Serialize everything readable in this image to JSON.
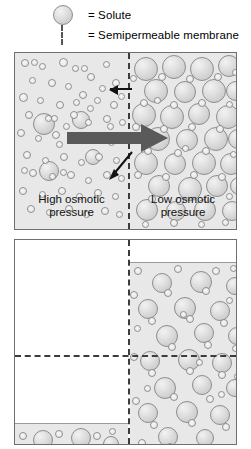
{
  "figure": {
    "background_color": "#ffffff",
    "fluid_color": "#e8e8e8",
    "membrane_color": "#3c3c3c",
    "arrow_color": "#5a5a5a",
    "outline_color": "#6f6f6f"
  },
  "legend": {
    "items": [
      {
        "icon": "solute-circle-icon",
        "equals": "= Solute"
      },
      {
        "icon": "dashed-line-icon",
        "equals": "= Semipermeable membrane"
      }
    ]
  },
  "top_panel": {
    "left_label_line1": "High osmotic",
    "left_label_line2": "pressure",
    "right_label_line1": "Low osmotic",
    "right_label_line2": "pressure",
    "arrows": [
      {
        "name": "water-flow-arrow-left",
        "direction": "left",
        "style": "thin-black"
      },
      {
        "name": "net-water-flow-arrow",
        "direction": "right",
        "style": "thick-gray"
      },
      {
        "name": "membrane-pointer-arrow",
        "direction": "down-left",
        "style": "thin-black"
      }
    ],
    "left_side": {
      "solute_size": "small",
      "description": "many small solute particles"
    },
    "right_side": {
      "solute_size": "large",
      "description": "many large solute particles"
    }
  },
  "bottom_panel": {
    "left_side": {
      "fill": "low",
      "description": "fluid level dropped, nearly empty"
    },
    "right_side": {
      "fill": "high",
      "description": "fluid level risen, dense solute"
    },
    "equilibrium_line": "horizontal dashed level line"
  },
  "circle_sets": {
    "top_left_small": [
      [
        6,
        6,
        8
      ],
      [
        24,
        10,
        7
      ],
      [
        44,
        5,
        9
      ],
      [
        57,
        12,
        7
      ],
      [
        72,
        20,
        8
      ],
      [
        14,
        24,
        7
      ],
      [
        33,
        26,
        8
      ],
      [
        50,
        30,
        7
      ],
      [
        88,
        8,
        7
      ],
      [
        97,
        26,
        8
      ],
      [
        64,
        38,
        8
      ],
      [
        4,
        40,
        9
      ],
      [
        22,
        44,
        7
      ],
      [
        41,
        48,
        8
      ],
      [
        79,
        44,
        7
      ],
      [
        95,
        48,
        8
      ],
      [
        10,
        58,
        8
      ],
      [
        30,
        62,
        7
      ],
      [
        55,
        58,
        8
      ],
      [
        70,
        66,
        7
      ],
      [
        88,
        62,
        8
      ],
      [
        103,
        40,
        7
      ],
      [
        104,
        66,
        7
      ],
      [
        2,
        76,
        8
      ],
      [
        20,
        82,
        7
      ],
      [
        37,
        78,
        8
      ],
      [
        60,
        84,
        7
      ],
      [
        77,
        80,
        8
      ],
      [
        93,
        86,
        7
      ],
      [
        48,
        70,
        7
      ],
      [
        8,
        98,
        8
      ],
      [
        27,
        104,
        7
      ],
      [
        45,
        100,
        8
      ],
      [
        63,
        106,
        7
      ],
      [
        80,
        100,
        8
      ],
      [
        98,
        104,
        7
      ],
      [
        14,
        116,
        8
      ],
      [
        34,
        120,
        7
      ],
      [
        52,
        118,
        8
      ],
      [
        70,
        124,
        7
      ],
      [
        88,
        118,
        8
      ],
      [
        103,
        122,
        7
      ],
      [
        4,
        134,
        8
      ],
      [
        24,
        138,
        7
      ],
      [
        43,
        134,
        8
      ],
      [
        61,
        140,
        7
      ],
      [
        79,
        136,
        8
      ],
      [
        97,
        140,
        7
      ],
      [
        12,
        152,
        8
      ],
      [
        31,
        156,
        7
      ],
      [
        50,
        152,
        8
      ],
      [
        68,
        158,
        7
      ],
      [
        86,
        154,
        8
      ],
      [
        101,
        158,
        7
      ],
      [
        41,
        88,
        7
      ],
      [
        66,
        12,
        7
      ],
      [
        16,
        6,
        7
      ],
      [
        84,
        32,
        7
      ],
      [
        58,
        46,
        7
      ],
      [
        36,
        62,
        7
      ],
      [
        72,
        52,
        7
      ],
      [
        92,
        70,
        7
      ],
      [
        6,
        114,
        7
      ],
      [
        45,
        116,
        7
      ]
    ],
    "top_left_large": [
      [
        18,
        60,
        22
      ],
      [
        57,
        58,
        18
      ],
      [
        24,
        108,
        20
      ],
      [
        70,
        96,
        16
      ]
    ],
    "top_right_large": [
      [
        4,
        4,
        24
      ],
      [
        32,
        2,
        24
      ],
      [
        60,
        4,
        24
      ],
      [
        88,
        2,
        22
      ],
      [
        14,
        26,
        24
      ],
      [
        44,
        28,
        22
      ],
      [
        72,
        26,
        24
      ],
      [
        96,
        28,
        20
      ],
      [
        2,
        50,
        24
      ],
      [
        30,
        52,
        24
      ],
      [
        58,
        50,
        22
      ],
      [
        86,
        52,
        24
      ],
      [
        16,
        74,
        24
      ],
      [
        46,
        76,
        22
      ],
      [
        74,
        74,
        24
      ],
      [
        98,
        76,
        20
      ],
      [
        4,
        98,
        24
      ],
      [
        34,
        100,
        22
      ],
      [
        62,
        98,
        24
      ],
      [
        90,
        100,
        22
      ],
      [
        18,
        122,
        22
      ],
      [
        48,
        124,
        24
      ],
      [
        76,
        122,
        22
      ],
      [
        100,
        124,
        18
      ],
      [
        6,
        146,
        22
      ],
      [
        36,
        148,
        20
      ],
      [
        64,
        146,
        22
      ],
      [
        92,
        148,
        20
      ]
    ],
    "top_right_small": [
      [
        28,
        20,
        8
      ],
      [
        56,
        22,
        8
      ],
      [
        84,
        20,
        8
      ],
      [
        10,
        46,
        8
      ],
      [
        40,
        48,
        8
      ],
      [
        68,
        46,
        8
      ],
      [
        96,
        48,
        7
      ],
      [
        2,
        70,
        8
      ],
      [
        30,
        72,
        8
      ],
      [
        58,
        70,
        8
      ],
      [
        86,
        72,
        8
      ],
      [
        14,
        94,
        8
      ],
      [
        44,
        96,
        8
      ],
      [
        72,
        94,
        8
      ],
      [
        4,
        118,
        8
      ],
      [
        32,
        120,
        8
      ],
      [
        60,
        118,
        8
      ],
      [
        88,
        120,
        8
      ],
      [
        18,
        142,
        8
      ],
      [
        46,
        144,
        8
      ],
      [
        74,
        142,
        8
      ],
      [
        100,
        98,
        7
      ],
      [
        102,
        16,
        7
      ],
      [
        0,
        22,
        7
      ],
      [
        24,
        44,
        7
      ],
      [
        52,
        92,
        7
      ],
      [
        96,
        140,
        7
      ],
      [
        12,
        168,
        7
      ],
      [
        40,
        166,
        8
      ],
      [
        68,
        168,
        7
      ],
      [
        92,
        166,
        7
      ]
    ],
    "bottom_right_large": [
      [
        22,
        10,
        20
      ],
      [
        60,
        8,
        22
      ],
      [
        96,
        14,
        18
      ],
      [
        8,
        36,
        20
      ],
      [
        44,
        34,
        22
      ],
      [
        80,
        38,
        20
      ],
      [
        26,
        62,
        22
      ],
      [
        64,
        60,
        20
      ],
      [
        98,
        64,
        18
      ],
      [
        10,
        88,
        20
      ],
      [
        48,
        86,
        22
      ],
      [
        82,
        90,
        20
      ],
      [
        24,
        114,
        22
      ],
      [
        62,
        112,
        20
      ],
      [
        96,
        116,
        18
      ],
      [
        8,
        140,
        20
      ],
      [
        46,
        138,
        22
      ],
      [
        80,
        142,
        20
      ],
      [
        28,
        164,
        20
      ],
      [
        66,
        166,
        18
      ]
    ],
    "bottom_right_small": [
      [
        4,
        4,
        8
      ],
      [
        44,
        2,
        8
      ],
      [
        82,
        4,
        8
      ],
      [
        100,
        2,
        7
      ],
      [
        34,
        26,
        8
      ],
      [
        72,
        24,
        8
      ],
      [
        0,
        28,
        8
      ],
      [
        96,
        34,
        7
      ],
      [
        18,
        54,
        8
      ],
      [
        56,
        52,
        8
      ],
      [
        90,
        56,
        8
      ],
      [
        4,
        62,
        7
      ],
      [
        38,
        80,
        8
      ],
      [
        74,
        78,
        8
      ],
      [
        102,
        82,
        7
      ],
      [
        0,
        90,
        8
      ],
      [
        18,
        106,
        8
      ],
      [
        56,
        104,
        8
      ],
      [
        88,
        108,
        8
      ],
      [
        104,
        110,
        7
      ],
      [
        40,
        130,
        8
      ],
      [
        76,
        132,
        8
      ],
      [
        2,
        134,
        8
      ],
      [
        20,
        158,
        8
      ],
      [
        58,
        156,
        8
      ],
      [
        92,
        160,
        8
      ],
      [
        106,
        154,
        7
      ],
      [
        36,
        180,
        8
      ],
      [
        72,
        182,
        8
      ],
      [
        8,
        176,
        8
      ],
      [
        50,
        48,
        7
      ],
      [
        88,
        128,
        7
      ],
      [
        14,
        122,
        7
      ],
      [
        66,
        96,
        7
      ]
    ],
    "bottom_left_large": [
      [
        18,
        6,
        20
      ],
      [
        56,
        4,
        20
      ],
      [
        12,
        26,
        18
      ],
      [
        52,
        28,
        18
      ],
      [
        88,
        12,
        16
      ]
    ],
    "bottom_left_small": [
      [
        4,
        8,
        8
      ],
      [
        40,
        6,
        8
      ],
      [
        78,
        8,
        8
      ],
      [
        94,
        4,
        7
      ],
      [
        2,
        28,
        8
      ],
      [
        34,
        26,
        8
      ],
      [
        72,
        30,
        8
      ],
      [
        98,
        26,
        7
      ],
      [
        22,
        32,
        7
      ],
      [
        60,
        32,
        7
      ],
      [
        86,
        30,
        7
      ]
    ]
  }
}
